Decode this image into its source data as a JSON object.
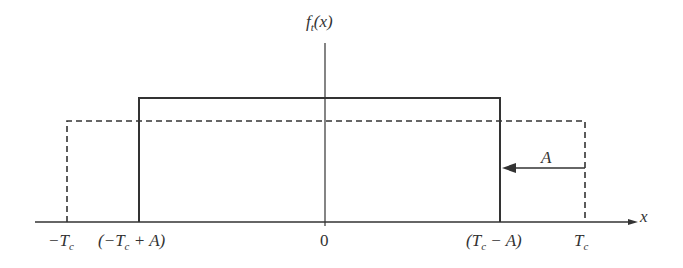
{
  "diagram": {
    "title": "",
    "y_label": {
      "func": "f",
      "subscript": "t",
      "arg": "(x)"
    },
    "x_label": "x",
    "ticks": [
      {
        "id": "neg_tc",
        "text": "−T",
        "sub": "c",
        "suffix": "",
        "x": 67
      },
      {
        "id": "neg_tc_plus_a",
        "text": "(−T",
        "sub": "c",
        "suffix": " + A)",
        "x": 139
      },
      {
        "id": "zero",
        "text": "0",
        "sub": "",
        "suffix": "",
        "x": 325
      },
      {
        "id": "tc_minus_a",
        "text": "(T",
        "sub": "c",
        "suffix": " − A)",
        "x": 500
      },
      {
        "id": "tc",
        "text": "T",
        "sub": "c",
        "suffix": "",
        "x": 585
      }
    ],
    "shapes": {
      "solid_rect": {
        "x_left": 139,
        "x_right": 500,
        "top": 98,
        "style": "solid"
      },
      "dashed_rect": {
        "x_left": 67,
        "x_right": 585,
        "top": 121,
        "style": "dashed"
      }
    },
    "arrow": {
      "label": "A",
      "from_x": 585,
      "to_x": 503,
      "y": 168
    },
    "colors": {
      "stroke": "#333333",
      "background": "#ffffff"
    }
  }
}
